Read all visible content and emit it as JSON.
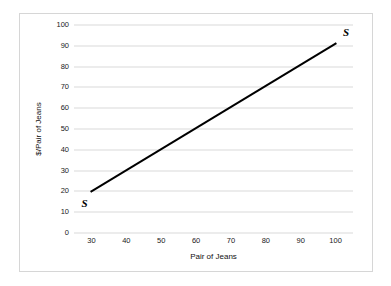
{
  "chart_data": {
    "type": "line",
    "title": "",
    "xlabel": "Pair of Jeans",
    "ylabel": "$/Pair of Jeans",
    "xlim": [
      25,
      105
    ],
    "ylim": [
      0,
      100
    ],
    "grid": "horizontal",
    "legend_position": "none",
    "xticks": [
      30,
      40,
      50,
      60,
      70,
      80,
      90,
      100
    ],
    "xtick_labels": [
      "30",
      "40",
      "50",
      "60",
      "70",
      "80",
      "90",
      "100"
    ],
    "yticks": [
      0,
      10,
      20,
      30,
      40,
      50,
      60,
      70,
      80,
      90,
      100
    ],
    "ytick_labels": [
      "0",
      "10",
      "20",
      "30",
      "40",
      "50",
      "60",
      "70",
      "80",
      "90",
      "100"
    ],
    "series": [
      {
        "name": "S",
        "color": "#000000",
        "line_width": 2,
        "x": [
          30,
          100
        ],
        "values": [
          20,
          91
        ]
      }
    ],
    "annotations": [
      {
        "text": "S",
        "x": 28,
        "y": 14,
        "position": "below-left-of-line-start"
      },
      {
        "text": "S",
        "x": 103,
        "y": 96,
        "position": "above-right-of-line-end"
      }
    ]
  },
  "colors": {
    "series_line": "#000000",
    "gridline": "#d9d9d9",
    "frame_border": "#d6d6d6",
    "tick_text": "#1a1a1a",
    "axis_title_text": "#111111",
    "background": "#ffffff"
  }
}
